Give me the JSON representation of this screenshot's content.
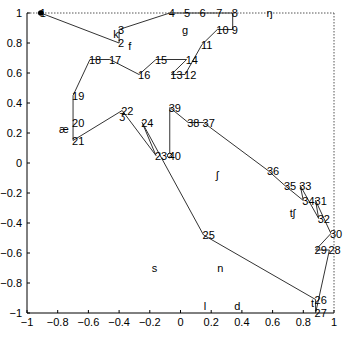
{
  "chart_data": {
    "type": "line",
    "title": "",
    "xlabel": "",
    "ylabel": "",
    "xlim": [
      -1,
      1
    ],
    "ylim": [
      -1,
      1
    ],
    "grid": false,
    "legend": "none",
    "xticks": [
      "−1",
      "−0.8",
      "−0.6",
      "−0.4",
      "−0.2",
      "0",
      "0.2",
      "0.4",
      "0.6",
      "0.8",
      "1"
    ],
    "xtick_values": [
      -1,
      -0.8,
      -0.6,
      -0.4,
      -0.2,
      0,
      0.2,
      0.4,
      0.6,
      0.8,
      1
    ],
    "yticks": [
      "−1",
      "−0.8",
      "−0.6",
      "−0.4",
      "−0.2",
      "0",
      "0.2",
      "0.4",
      "0.6",
      "0.8",
      "1"
    ],
    "ytick_values": [
      -1,
      -0.8,
      -0.6,
      -0.4,
      -0.2,
      0,
      0.2,
      0.4,
      0.6,
      0.8,
      1
    ],
    "series": [
      {
        "name": "path",
        "color": "#333333",
        "start_marker": "filled-dot",
        "end_marker": "open-circle",
        "points": [
          {
            "label": "1",
            "x": -0.91,
            "y": 1.0
          },
          {
            "label": "2",
            "x": -0.4,
            "y": 0.8
          },
          {
            "label": "3",
            "x": -0.4,
            "y": 0.89
          },
          {
            "label": "4",
            "x": -0.07,
            "y": 1.0
          },
          {
            "label": "5",
            "x": 0.03,
            "y": 1.0
          },
          {
            "label": "6",
            "x": 0.13,
            "y": 1.0
          },
          {
            "label": "7",
            "x": 0.24,
            "y": 1.0
          },
          {
            "label": "8",
            "x": 0.34,
            "y": 1.0
          },
          {
            "label": "9",
            "x": 0.34,
            "y": 0.89
          },
          {
            "label": "10",
            "x": 0.24,
            "y": 0.89
          },
          {
            "label": "11",
            "x": 0.14,
            "y": 0.79
          },
          {
            "label": "12",
            "x": 0.03,
            "y": 0.59
          },
          {
            "label": "13",
            "x": -0.06,
            "y": 0.59
          },
          {
            "label": "14",
            "x": 0.04,
            "y": 0.69
          },
          {
            "label": "15",
            "x": -0.16,
            "y": 0.69
          },
          {
            "label": "16",
            "x": -0.27,
            "y": 0.59
          },
          {
            "label": "17",
            "x": -0.46,
            "y": 0.69
          },
          {
            "label": "18",
            "x": -0.59,
            "y": 0.69
          },
          {
            "label": "19",
            "x": -0.7,
            "y": 0.45
          },
          {
            "label": "20",
            "x": -0.7,
            "y": 0.27
          },
          {
            "label": "21",
            "x": -0.7,
            "y": 0.15
          },
          {
            "label": "22",
            "x": -0.38,
            "y": 0.35
          },
          {
            "label": "23",
            "x": -0.16,
            "y": 0.05
          },
          {
            "label": "24",
            "x": -0.25,
            "y": 0.27
          },
          {
            "label": "25",
            "x": 0.15,
            "y": -0.48
          },
          {
            "label": "26",
            "x": 0.88,
            "y": -0.91
          },
          {
            "label": "27",
            "x": 0.88,
            "y": -1.0
          },
          {
            "label": "28",
            "x": 0.97,
            "y": -0.58
          },
          {
            "label": "29",
            "x": 0.88,
            "y": -0.58
          },
          {
            "label": "30",
            "x": 0.98,
            "y": -0.47
          },
          {
            "label": "31",
            "x": 0.88,
            "y": -0.25
          },
          {
            "label": "32",
            "x": 0.9,
            "y": -0.37
          },
          {
            "label": "33",
            "x": 0.78,
            "y": -0.15
          },
          {
            "label": "34",
            "x": 0.8,
            "y": -0.25
          },
          {
            "label": "35",
            "x": 0.68,
            "y": -0.15
          },
          {
            "label": "36",
            "x": 0.57,
            "y": -0.05
          },
          {
            "label": "37",
            "x": 0.15,
            "y": 0.27
          },
          {
            "label": "38",
            "x": 0.05,
            "y": 0.27
          },
          {
            "label": "39",
            "x": -0.07,
            "y": 0.37
          },
          {
            "label": "40",
            "x": -0.07,
            "y": 0.05
          }
        ]
      }
    ],
    "annotations": [
      {
        "text": "k",
        "x": -0.42,
        "y": 0.86
      },
      {
        "text": "f",
        "x": -0.33,
        "y": 0.78
      },
      {
        "text": "g",
        "x": 0.03,
        "y": 0.89
      },
      {
        "text": "ŋ",
        "x": 0.58,
        "y": 1.0
      },
      {
        "text": "æ",
        "x": -0.76,
        "y": 0.23
      },
      {
        "text": "ʒ",
        "x": -0.38,
        "y": 0.32
      },
      {
        "text": "ʃ",
        "x": 0.24,
        "y": -0.08
      },
      {
        "text": "tʃ",
        "x": 0.73,
        "y": -0.33
      },
      {
        "text": "s",
        "x": -0.17,
        "y": -0.7
      },
      {
        "text": "n",
        "x": 0.26,
        "y": -0.7
      },
      {
        "text": "l",
        "x": 0.16,
        "y": -0.95
      },
      {
        "text": "d",
        "x": 0.37,
        "y": -0.95
      },
      {
        "text": "t",
        "x": 0.86,
        "y": -0.93
      }
    ]
  }
}
